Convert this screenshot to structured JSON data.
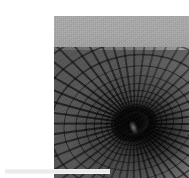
{
  "page": {
    "background_color": "#ffffff",
    "width": 189,
    "height": 178
  },
  "figure": {
    "palette": {
      "backdrop_band": "#ababab",
      "cone_dark_side": "#3a3a3a",
      "cone_light_side": "#c4c4c4",
      "throat_void": "#000000",
      "mesh_line": "#1a1a1a"
    },
    "geometry": {
      "vortex_center_x": 80,
      "vortex_center_y": 107,
      "rib_count": 48,
      "ring_count": 22,
      "backdrop_band_height": 32
    }
  },
  "caption": {
    "text": "",
    "bar_color": "#eeeeee"
  }
}
